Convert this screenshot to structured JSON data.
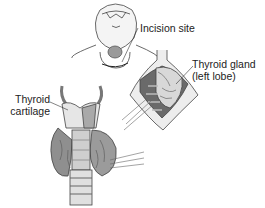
{
  "figure": {
    "labels": {
      "incision_site": "Incision site",
      "thyroid_gland_line1": "Thyroid gland",
      "thyroid_gland_line2": "(left lobe)",
      "thyroid_cartilage_line1": "Thyroid",
      "thyroid_cartilage_line2": "cartilage"
    },
    "colors": {
      "ink": "#333333",
      "shade_dark": "#555555",
      "shade_mid": "#9a9a9a",
      "shade_light": "#cfcfcf",
      "background": "#ffffff"
    }
  }
}
